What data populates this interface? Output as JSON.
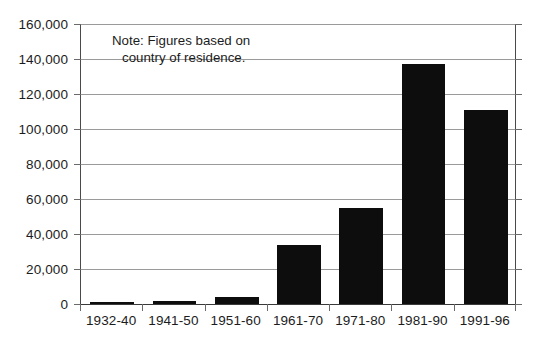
{
  "chart_data": {
    "type": "bar",
    "title": "",
    "subtitle": "",
    "xlabel": "",
    "ylabel": "",
    "categories": [
      "1932-40",
      "1941-50",
      "1951-60",
      "1961-70",
      "1971-80",
      "1981-90",
      "1991-96"
    ],
    "values": [
      700,
      1500,
      4000,
      33500,
      55000,
      137000,
      111000
    ],
    "series": [
      {
        "name": "Immigrants",
        "values": [
          700,
          1500,
          4000,
          33500,
          55000,
          137000,
          111000
        ]
      }
    ],
    "ylim": [
      0,
      160000
    ],
    "ytick_values": [
      0,
      20000,
      40000,
      60000,
      80000,
      100000,
      120000,
      140000,
      160000
    ],
    "ytick_labels": [
      "0",
      "20,000",
      "40,000",
      "60,000",
      "80,000",
      "100,000",
      "120,000",
      "140,000",
      "160,000"
    ],
    "grid": true,
    "legend": false,
    "legend_position": "none",
    "bar_color": "#0d0d0d",
    "gridline_color": "#9a9a9a",
    "axis_color": "#4a4a4a",
    "annotations": [
      {
        "name": "note",
        "line1": "Note: Figures based on",
        "line2": "country of residence."
      }
    ]
  }
}
